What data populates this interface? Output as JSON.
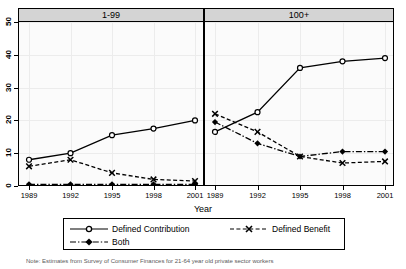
{
  "chart_data": {
    "type": "line",
    "title": "",
    "xlabel": "Year",
    "ylabel": "",
    "ylim": [
      0,
      50
    ],
    "yticks": [
      0,
      10,
      20,
      30,
      40,
      50
    ],
    "grid": true,
    "legend_position": "bottom",
    "x": [
      1989,
      1992,
      1995,
      1998,
      2001
    ],
    "panels": [
      {
        "label": "1-99",
        "series": [
          {
            "name": "Defined Contribution",
            "marker": "circle-open",
            "linestyle": "solid",
            "values": [
              8.0,
              10.0,
              15.5,
              17.5,
              20.0
            ]
          },
          {
            "name": "Defined Benefit",
            "marker": "x",
            "linestyle": "dashed",
            "values": [
              6.0,
              8.0,
              4.0,
              2.0,
              1.5
            ]
          },
          {
            "name": "Both",
            "marker": "diamond",
            "linestyle": "dashdot",
            "values": [
              0.5,
              0.5,
              0.5,
              0.5,
              0.5
            ]
          }
        ]
      },
      {
        "label": "100+",
        "series": [
          {
            "name": "Defined Contribution",
            "marker": "circle-open",
            "linestyle": "solid",
            "values": [
              16.5,
              22.5,
              36.0,
              38.0,
              39.0
            ]
          },
          {
            "name": "Defined Benefit",
            "marker": "x",
            "linestyle": "dashed",
            "values": [
              22.0,
              16.5,
              9.0,
              7.0,
              7.5
            ]
          },
          {
            "name": "Both",
            "marker": "diamond",
            "linestyle": "dashdot",
            "values": [
              19.5,
              13.0,
              9.0,
              10.5,
              10.5
            ]
          }
        ]
      }
    ],
    "legend": [
      {
        "name": "Defined Contribution",
        "marker": "circle-open",
        "linestyle": "solid"
      },
      {
        "name": "Defined Benefit",
        "marker": "x",
        "linestyle": "dashed"
      },
      {
        "name": "Both",
        "marker": "diamond",
        "linestyle": "dashdot"
      }
    ],
    "note": "Note: Estimates from Survey of Consumer Finances for 21-64 year old private sector workers"
  }
}
